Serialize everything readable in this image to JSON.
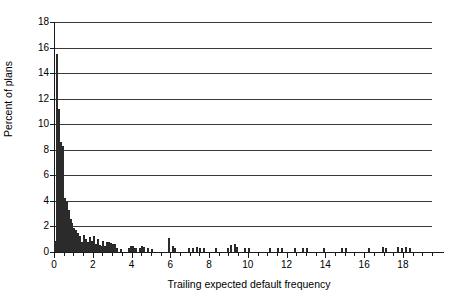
{
  "chart_data": {
    "type": "bar",
    "title": "",
    "subtitle": "",
    "xlabel": "Trailing expected default frequency",
    "ylabel": "Percent of plans",
    "xlim": [
      0,
      19.5
    ],
    "ylim": [
      0,
      18
    ],
    "grid": true,
    "legend": null,
    "annotations": [],
    "bin_width": 0.1,
    "x_ticks_major": [
      0,
      2,
      4,
      6,
      8,
      10,
      12,
      14,
      16,
      18
    ],
    "x_tick_labels": [
      "0",
      "2",
      "4",
      "6",
      "8",
      "10",
      "12",
      "14",
      "16",
      "18"
    ],
    "x_ticks_minor": [
      0.5,
      1,
      1.5,
      2.5,
      3,
      3.5,
      4.5,
      5,
      5.5,
      6.5,
      7,
      7.5,
      8.5,
      9,
      9.5,
      10.5,
      11,
      11.5,
      12.5,
      13,
      13.5,
      14.5,
      15,
      15.5,
      16.5,
      17,
      17.5,
      18.5,
      19,
      19.5
    ],
    "y_ticks": [
      0,
      2,
      4,
      6,
      8,
      10,
      12,
      14,
      16,
      18
    ],
    "y_tick_labels": [
      "0",
      "2",
      "4",
      "6",
      "8",
      "10",
      "12",
      "14",
      "16",
      "18"
    ],
    "bars": [
      {
        "x": 0.05,
        "y": 0.9
      },
      {
        "x": 0.15,
        "y": 15.5
      },
      {
        "x": 0.25,
        "y": 11.2
      },
      {
        "x": 0.35,
        "y": 8.6
      },
      {
        "x": 0.45,
        "y": 8.3
      },
      {
        "x": 0.55,
        "y": 4.2
      },
      {
        "x": 0.65,
        "y": 3.9
      },
      {
        "x": 0.75,
        "y": 3.3
      },
      {
        "x": 0.85,
        "y": 2.6
      },
      {
        "x": 0.95,
        "y": 2.3
      },
      {
        "x": 1.05,
        "y": 1.9
      },
      {
        "x": 1.15,
        "y": 1.7
      },
      {
        "x": 1.25,
        "y": 1.5
      },
      {
        "x": 1.35,
        "y": 1.25
      },
      {
        "x": 1.45,
        "y": 0.8
      },
      {
        "x": 1.55,
        "y": 1.3
      },
      {
        "x": 1.65,
        "y": 1.0
      },
      {
        "x": 1.75,
        "y": 0.75
      },
      {
        "x": 1.85,
        "y": 1.15
      },
      {
        "x": 1.95,
        "y": 0.85
      },
      {
        "x": 2.05,
        "y": 1.25
      },
      {
        "x": 2.15,
        "y": 0.6
      },
      {
        "x": 2.25,
        "y": 1.0
      },
      {
        "x": 2.35,
        "y": 0.55
      },
      {
        "x": 2.45,
        "y": 0.5
      },
      {
        "x": 2.55,
        "y": 0.85
      },
      {
        "x": 2.65,
        "y": 0.45
      },
      {
        "x": 2.75,
        "y": 0.8
      },
      {
        "x": 2.85,
        "y": 0.75
      },
      {
        "x": 2.95,
        "y": 0.7
      },
      {
        "x": 3.05,
        "y": 0.65
      },
      {
        "x": 3.15,
        "y": 0.6
      },
      {
        "x": 3.25,
        "y": 0.3
      },
      {
        "x": 3.45,
        "y": 0.25
      },
      {
        "x": 3.85,
        "y": 0.3
      },
      {
        "x": 3.95,
        "y": 0.45
      },
      {
        "x": 4.05,
        "y": 0.5
      },
      {
        "x": 4.15,
        "y": 0.35
      },
      {
        "x": 4.25,
        "y": 0.3
      },
      {
        "x": 4.45,
        "y": 0.3
      },
      {
        "x": 4.55,
        "y": 0.45
      },
      {
        "x": 4.65,
        "y": 0.4
      },
      {
        "x": 4.85,
        "y": 0.3
      },
      {
        "x": 5.05,
        "y": 0.25
      },
      {
        "x": 5.95,
        "y": 1.1
      },
      {
        "x": 6.15,
        "y": 0.45
      },
      {
        "x": 6.25,
        "y": 0.3
      },
      {
        "x": 6.95,
        "y": 0.3
      },
      {
        "x": 7.15,
        "y": 0.35
      },
      {
        "x": 7.35,
        "y": 0.4
      },
      {
        "x": 7.55,
        "y": 0.35
      },
      {
        "x": 7.75,
        "y": 0.3
      },
      {
        "x": 8.35,
        "y": 0.35
      },
      {
        "x": 8.95,
        "y": 0.3
      },
      {
        "x": 9.15,
        "y": 0.55
      },
      {
        "x": 9.35,
        "y": 0.6
      },
      {
        "x": 9.45,
        "y": 0.4
      },
      {
        "x": 9.85,
        "y": 0.3
      },
      {
        "x": 10.05,
        "y": 0.3
      },
      {
        "x": 11.15,
        "y": 0.35
      },
      {
        "x": 11.55,
        "y": 0.3
      },
      {
        "x": 11.75,
        "y": 0.3
      },
      {
        "x": 12.45,
        "y": 0.35
      },
      {
        "x": 12.85,
        "y": 0.3
      },
      {
        "x": 13.05,
        "y": 0.3
      },
      {
        "x": 13.95,
        "y": 0.35
      },
      {
        "x": 14.85,
        "y": 0.3
      },
      {
        "x": 15.05,
        "y": 0.3
      },
      {
        "x": 16.25,
        "y": 0.35
      },
      {
        "x": 16.95,
        "y": 0.4
      },
      {
        "x": 17.15,
        "y": 0.3
      },
      {
        "x": 17.75,
        "y": 0.4
      },
      {
        "x": 17.95,
        "y": 0.35
      },
      {
        "x": 18.15,
        "y": 0.4
      },
      {
        "x": 18.35,
        "y": 0.35
      }
    ],
    "colors": {
      "bar_fill": "#9e9e9e",
      "bar_edge": "#1f1f1f",
      "gridline": "#3a3a3a",
      "axis": "#1a1a1a",
      "background": "#ffffff"
    }
  }
}
